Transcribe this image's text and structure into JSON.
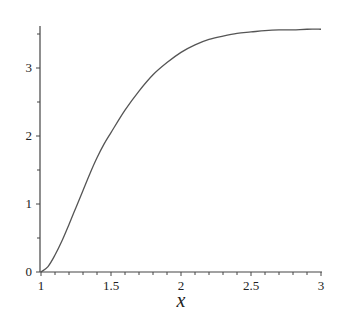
{
  "chart_data": {
    "type": "line",
    "title": "",
    "xlabel": "x",
    "ylabel": "",
    "xlim": [
      1,
      3
    ],
    "ylim": [
      0,
      3.6
    ],
    "grid": false,
    "legend": null,
    "x_ticks": [
      "1",
      "1.5",
      "2",
      "2.5",
      "3"
    ],
    "y_ticks": [
      "0",
      "1",
      "2",
      "3"
    ],
    "series": [
      {
        "name": "curve",
        "color": "#555555",
        "x": [
          1.0,
          1.05,
          1.1,
          1.15,
          1.2,
          1.25,
          1.3,
          1.35,
          1.4,
          1.45,
          1.5,
          1.6,
          1.7,
          1.8,
          1.9,
          2.0,
          2.1,
          2.2,
          2.3,
          2.4,
          2.5,
          2.6,
          2.7,
          2.8,
          2.9,
          3.0
        ],
        "y": [
          0.0,
          0.08,
          0.25,
          0.46,
          0.7,
          0.95,
          1.2,
          1.45,
          1.68,
          1.88,
          2.05,
          2.38,
          2.66,
          2.9,
          3.08,
          3.23,
          3.34,
          3.42,
          3.47,
          3.51,
          3.53,
          3.55,
          3.56,
          3.56,
          3.57,
          3.57
        ]
      }
    ]
  }
}
